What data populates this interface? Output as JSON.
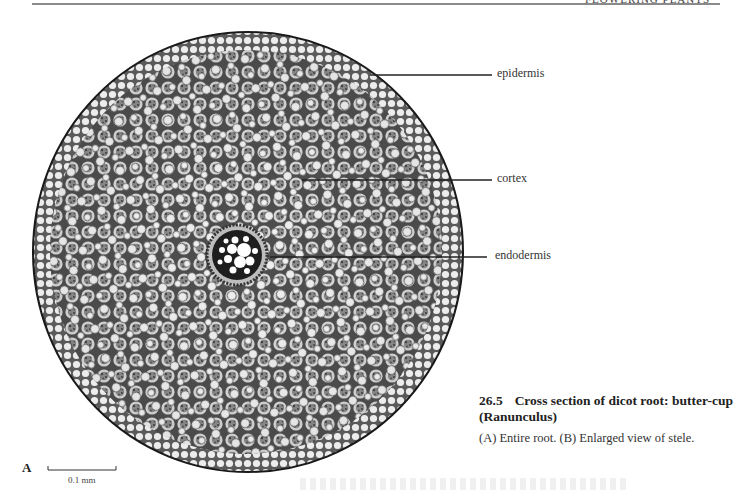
{
  "page": {
    "running_head": "FLOWERING PLANTS",
    "running_head_clipped": true
  },
  "figure": {
    "panel": "A",
    "subject": "Cross section of dicot root",
    "labels": [
      {
        "text": "epidermis",
        "line": {
          "x1": 370,
          "y1": 75,
          "x2": 492,
          "y2": 75
        },
        "x": 497,
        "y": 66
      },
      {
        "text": "cortex",
        "line": {
          "x1": 302,
          "y1": 180,
          "x2": 492,
          "y2": 180
        },
        "x": 497,
        "y": 171
      },
      {
        "text": "endodermis",
        "line": {
          "x1": 270,
          "y1": 257,
          "x2": 487,
          "y2": 257
        },
        "x": 495,
        "y": 248
      }
    ],
    "scale_bar": {
      "label": "0.1 mm",
      "x1": 48,
      "x2": 116,
      "y": 470
    }
  },
  "caption": {
    "number": "26.5",
    "title": "Cross section of dicot root: butter-cup (Ranunculus)",
    "body": "(A) Entire root. (B) Enlarged view of stele."
  },
  "colors": {
    "cell_wall": "#3a3a3a",
    "cell_fill": "#e6e6e6",
    "starch_dark": "#6e6e6e",
    "stele_dark": "#1e1e1e"
  }
}
